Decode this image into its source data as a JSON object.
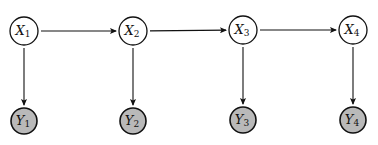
{
  "diagram": {
    "type": "hidden-markov-model",
    "colors": {
      "background": "#ffffff",
      "stroke": "#111111",
      "hidden_fill": "#ffffff",
      "observed_fill": "#b9b9b9"
    },
    "hidden_nodes": [
      {
        "id": "X1",
        "var": "X",
        "sub": "1",
        "cx": 24,
        "cy": 31
      },
      {
        "id": "X2",
        "var": "X",
        "sub": "2",
        "cx": 133,
        "cy": 31
      },
      {
        "id": "X3",
        "var": "X",
        "sub": "3",
        "cx": 243,
        "cy": 30
      },
      {
        "id": "X4",
        "var": "X",
        "sub": "4",
        "cx": 353,
        "cy": 30
      }
    ],
    "observed_nodes": [
      {
        "id": "Y1",
        "var": "Y",
        "sub": "1",
        "cx": 24,
        "cy": 121
      },
      {
        "id": "Y2",
        "var": "Y",
        "sub": "2",
        "cx": 133,
        "cy": 121
      },
      {
        "id": "Y3",
        "var": "Y",
        "sub": "3",
        "cx": 243,
        "cy": 120
      },
      {
        "id": "Y4",
        "var": "Y",
        "sub": "4",
        "cx": 353,
        "cy": 120
      }
    ],
    "edges": [
      {
        "from": "X1",
        "to": "X2"
      },
      {
        "from": "X2",
        "to": "X3"
      },
      {
        "from": "X3",
        "to": "X4"
      },
      {
        "from": "X1",
        "to": "Y1"
      },
      {
        "from": "X2",
        "to": "Y2"
      },
      {
        "from": "X3",
        "to": "Y3"
      },
      {
        "from": "X4",
        "to": "Y4"
      }
    ]
  }
}
